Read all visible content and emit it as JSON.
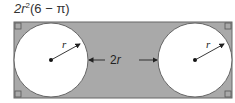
{
  "answer": {
    "prefix": "2r",
    "exponent": "2",
    "rest": "(6 − π)"
  },
  "diagram": {
    "rect": {
      "x": 14,
      "y": 22,
      "width": 218,
      "height": 76,
      "fill": "#a9a9a9",
      "stroke": "#666666"
    },
    "circles": [
      {
        "cx": 51,
        "cy": 60,
        "r": 37,
        "fill": "#ffffff"
      },
      {
        "cx": 195,
        "cy": 60,
        "r": 37,
        "fill": "#ffffff"
      }
    ],
    "radius_label": "r",
    "distance_label": "2r",
    "right_angle_markers": 4
  }
}
